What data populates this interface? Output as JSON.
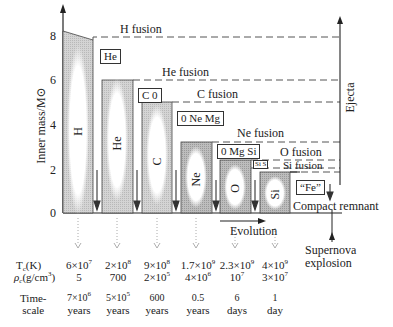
{
  "figure": {
    "y_axis_label": "Inner mass/M⊙",
    "y_ticks": [
      "0",
      "2",
      "4",
      "6",
      "8"
    ],
    "x_axis_label": "Evolution",
    "right_axis_label": "Ejecta",
    "remnant_label": "Compact remnant",
    "supernova_label_1": "Supernova",
    "supernova_label_2": "explosion"
  },
  "fusion_labels": [
    "H fusion",
    "He fusion",
    "C fusion",
    "Ne fusion",
    "O fusion",
    "Si fusion"
  ],
  "core_boxes": [
    "He",
    "C 0",
    "0 Ne Mg",
    "0 Mg Si",
    "Si S",
    "“Fe”"
  ],
  "shell_labels": [
    "H",
    "He",
    "C",
    "Ne",
    "O",
    "Si"
  ],
  "table": {
    "row_labels": {
      "temperature": "T",
      "temperature_sub": "c",
      "temperature_unit": "(K)",
      "density": "ρ",
      "density_sub": "c",
      "density_unit": "(g/cm",
      "density_unit_sup": "3",
      "density_unit_end": ")",
      "timescale_1": "Time-",
      "timescale_2": "scale"
    },
    "columns": [
      {
        "t_base": "6×10",
        "t_exp": "7",
        "rho_base": "5",
        "rho_exp": "",
        "time_val": "7×10",
        "time_exp": "6",
        "time_unit": "years"
      },
      {
        "t_base": "2×10",
        "t_exp": "8",
        "rho_base": "700",
        "rho_exp": "",
        "time_val": "5×10",
        "time_exp": "5",
        "time_unit": "years"
      },
      {
        "t_base": "9×10",
        "t_exp": "8",
        "rho_base": "2×10",
        "rho_exp": "5",
        "time_val": "600",
        "time_exp": "",
        "time_unit": "years"
      },
      {
        "t_base": "1.7×10",
        "t_exp": "9",
        "rho_base": "4×10",
        "rho_exp": "6",
        "time_val": "0.5",
        "time_exp": "",
        "time_unit": "years"
      },
      {
        "t_base": "2.3×10",
        "t_exp": "9",
        "rho_base": "10",
        "rho_exp": "7",
        "time_val": "6",
        "time_exp": "",
        "time_unit": "days"
      },
      {
        "t_base": "4×10",
        "t_exp": "9",
        "rho_base": "3×10",
        "rho_exp": "7",
        "time_val": "1",
        "time_exp": "",
        "time_unit": "day"
      }
    ]
  },
  "colors": {
    "ink": "#222222",
    "shell_fill": "#c8c8c8",
    "shell_light": "#e6e6e6",
    "dash": "#555555"
  }
}
